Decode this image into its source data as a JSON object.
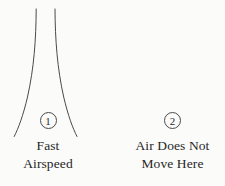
{
  "figure": {
    "type": "airflow-venturi-diagram",
    "background_color": "#fbfbfa",
    "line_color": "#4a4a4a"
  },
  "callouts": [
    {
      "number": "1",
      "caption": "Fast\nAirspeed",
      "caption_line_1": "Fast",
      "caption_line_2": "Airspeed"
    },
    {
      "number": "2",
      "caption": "Air Does Not\nMove Here",
      "caption_line_1": "Air Does Not",
      "caption_line_2": "Move Here"
    }
  ],
  "shapes": {
    "left_curve_name": "funnel-left-wall",
    "right_curve_name": "funnel-right-wall",
    "left_curve_path": "M 36.2 9 C 36.0 40, 34.0 68, 27.5 97 C 23.0 116, 18.5 128, 14.2 136.5",
    "right_curve_path": "M 55.0 9 C 55.2 40, 57.2 68, 63.7 97 C 68.2 116, 72.7 128, 77.0 136.5"
  }
}
